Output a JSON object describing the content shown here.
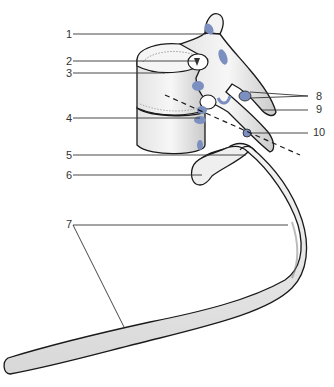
{
  "figure": {
    "colors": {
      "bone_fill": "#f2f2f2",
      "bone_shade": "#cfcfcf",
      "outline": "#1a1a1a",
      "facet_blue": "#7b8fc0",
      "leader_line": "#333333",
      "background": "#ffffff"
    }
  },
  "labels": [
    {
      "id": "1",
      "text": "1",
      "side": "left",
      "x": 60,
      "y": 29
    },
    {
      "id": "2",
      "text": "2",
      "side": "left",
      "x": 60,
      "y": 56
    },
    {
      "id": "3",
      "text": "3",
      "side": "left",
      "x": 60,
      "y": 68
    },
    {
      "id": "4",
      "text": "4",
      "side": "left",
      "x": 60,
      "y": 113
    },
    {
      "id": "5",
      "text": "5",
      "side": "left",
      "x": 60,
      "y": 150
    },
    {
      "id": "6",
      "text": "6",
      "side": "left",
      "x": 60,
      "y": 170
    },
    {
      "id": "7",
      "text": "7",
      "side": "left",
      "x": 60,
      "y": 219
    },
    {
      "id": "8",
      "text": "8",
      "side": "right",
      "x": 316,
      "y": 91
    },
    {
      "id": "9",
      "text": "9",
      "side": "right",
      "x": 316,
      "y": 104
    },
    {
      "id": "10",
      "text": "10",
      "side": "right",
      "x": 313,
      "y": 127
    }
  ]
}
